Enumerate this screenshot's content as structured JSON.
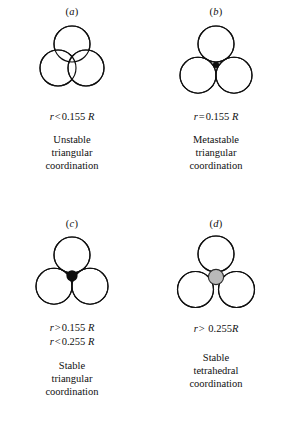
{
  "figure": {
    "type": "coordination-geometry-diagram",
    "colors": {
      "stroke": "#101010",
      "background": "#ffffff",
      "cation_solid": "#0d0d0d",
      "cation_gray_fill": "#b9b9b9",
      "cation_gray_stroke": "#2a2a2a"
    },
    "panels": [
      {
        "id": "a",
        "letter": "a",
        "letter_display": "(a)",
        "geometry": {
          "kind": "three-overlapping-circles",
          "anion_radius": 18,
          "center_distance": 28,
          "cation": "none",
          "overlap": true,
          "note": "circles interpenetrate; cation too small to separate anions"
        },
        "formulas": [
          {
            "left": "r",
            "op": "<",
            "number": "0.155",
            "right": "R",
            "spaced": true
          }
        ],
        "caption": [
          "Unstable",
          "triangular",
          "coordination"
        ]
      },
      {
        "id": "b",
        "letter": "b",
        "letter_display": "(b)",
        "geometry": {
          "kind": "three-tangent-circles",
          "anion_radius": 18,
          "center_distance": 36,
          "cation": "small-black-dot",
          "cation_radius": 2.8,
          "overlap": false,
          "note": "circles exactly tangent; cation just fits the interstice"
        },
        "formulas": [
          {
            "left": "r",
            "op": "=",
            "number": "0.155",
            "right": "R",
            "spaced": true
          }
        ],
        "caption": [
          "Metastable",
          "triangular",
          "coordination"
        ]
      },
      {
        "id": "c",
        "letter": "c",
        "letter_display": "(c)",
        "geometry": {
          "kind": "three-tangent-circles",
          "anion_radius": 18,
          "center_distance": 36,
          "cation": "large-black-dot",
          "cation_radius": 5.4,
          "overlap": false,
          "note": "circles tangent; larger cation seated in interstice"
        },
        "formulas": [
          {
            "left": "r",
            "op": ">",
            "number": "0.155",
            "right": "R",
            "spaced": true
          },
          {
            "left": "r",
            "op": "<",
            "number": "0.255",
            "right": "R",
            "spaced": true
          }
        ],
        "caption": [
          "Stable",
          "triangular",
          "coordination"
        ]
      },
      {
        "id": "d",
        "letter": "d",
        "letter_display": "(d)",
        "geometry": {
          "kind": "three-separated-circles",
          "anion_radius": 18,
          "center_distance": 40,
          "cation": "gray-sphere",
          "cation_radius": 7.5,
          "overlap": false,
          "note": "cation too large for triangular hole; anions pushed apart, tetrahedral site"
        },
        "formulas": [
          {
            "left": "r",
            "op": ">",
            "number": "0.255",
            "right": "R",
            "spaced": false
          }
        ],
        "caption": [
          "Stable",
          "tetrahedral",
          "coordination"
        ]
      }
    ]
  }
}
